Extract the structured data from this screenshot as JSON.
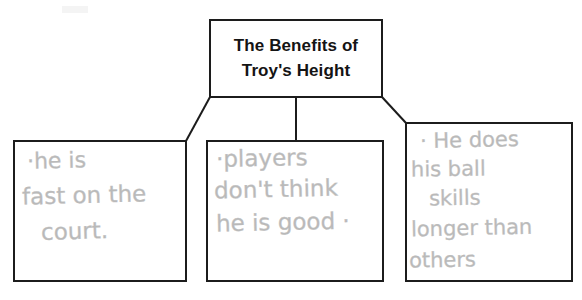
{
  "document": {
    "type": "handwritten-graphic-organizer",
    "page_background": "#ffffff",
    "ink_color": "#b9b9b9",
    "line_color": "#1c1c1c"
  },
  "title_box": {
    "name": "root-node",
    "line1": "The Benefits of",
    "line2": "Troy's Height",
    "text_color": "#141414"
  },
  "children": [
    {
      "id": "left",
      "name": "supporting-detail-1",
      "lines": [
        "·he is",
        "fast on the",
        "court."
      ]
    },
    {
      "id": "middle",
      "name": "supporting-detail-2",
      "lines": [
        "·players",
        "don't think",
        "he is good ·"
      ]
    },
    {
      "id": "right",
      "name": "supporting-detail-3",
      "lines": [
        "·  He does",
        "his ball",
        "skills",
        "longer than",
        "others"
      ]
    }
  ],
  "connectors": {
    "left_branch": "title-box bottom-left corner to left box top-right corner",
    "middle_branch": "title-box bottom-center to middle box top-center",
    "right_branch": "title-box bottom-right corner to right box top-left corner"
  }
}
